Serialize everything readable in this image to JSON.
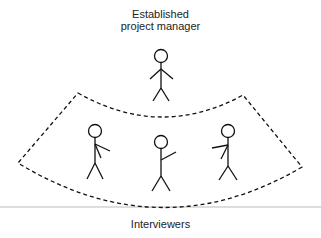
{
  "diagram": {
    "top_label_line1": "Established",
    "top_label_line2": "project manager",
    "bottom_label": "Interviewers",
    "figures": [
      {
        "role": "established-project-manager",
        "position": "top-center"
      },
      {
        "role": "interviewer",
        "position": "left"
      },
      {
        "role": "interviewer",
        "position": "center"
      },
      {
        "role": "interviewer",
        "position": "right"
      }
    ],
    "grouping": "dashed-curved-boundary-around-interviewers",
    "colors": {
      "stroke": "#111111",
      "divider": "#bbbbbb",
      "text": "#222222"
    }
  }
}
